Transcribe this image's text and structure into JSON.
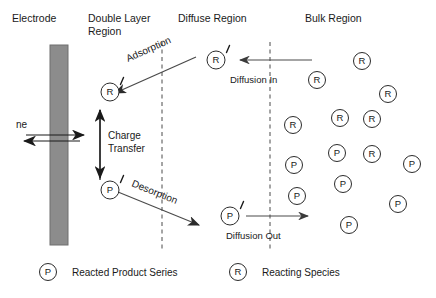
{
  "regions": [
    {
      "id": "electrode",
      "label": "Electrode",
      "x": 12,
      "y": 22
    },
    {
      "id": "double-layer",
      "label": "Double Layer",
      "x": 88,
      "y": 22
    },
    {
      "id": "double-layer-2",
      "label": "Region",
      "x": 88,
      "y": 35
    },
    {
      "id": "diffuse",
      "label": "Diffuse Region",
      "x": 178,
      "y": 22
    },
    {
      "id": "bulk",
      "label": "Bulk Region",
      "x": 305,
      "y": 22
    }
  ],
  "electrode": {
    "name": "electrode-bar",
    "color": "#8c8c8c",
    "x": 50,
    "y": 45,
    "width": 18,
    "height": 200
  },
  "dividers": [
    {
      "id": "divider-double-layer",
      "x": 162,
      "y1": 42,
      "y2": 250
    },
    {
      "id": "divider-diffuse",
      "x": 270,
      "y1": 42,
      "y2": 250
    }
  ],
  "electron_transfer": {
    "label": "ne",
    "label_x": 16,
    "label_y": 128,
    "y_forward": 135,
    "y_back": 141,
    "x_left": 22,
    "x_right": 84
  },
  "charge_transfer": {
    "label_line1": "Charge",
    "label_line2": "Transfer",
    "label_x": 108,
    "label_y1": 138,
    "label_y2": 151,
    "arrow_x": 100,
    "arrow_top": 108,
    "arrow_bottom": 180
  },
  "processes": [
    {
      "id": "adsorption",
      "label": "Adsorption",
      "x1": 196,
      "y1": 57,
      "x2": 113,
      "y2": 94,
      "label_x": 128,
      "label_y": 62,
      "rotation": -24
    },
    {
      "id": "desorption",
      "label": "Desorption",
      "x1": 116,
      "y1": 191,
      "x2": 199,
      "y2": 225,
      "label_x": 131,
      "label_y": 185,
      "rotation": 22
    },
    {
      "id": "diffusion-in",
      "label": "Diffusion In",
      "x1": 310,
      "y1": 60,
      "x2": 241,
      "y2": 60,
      "label_x": 232,
      "label_y": 82
    },
    {
      "id": "diffusion-out",
      "label": "Diffusion Out",
      "x1": 238,
      "y1": 216,
      "x2": 307,
      "y2": 216,
      "label_x": 228,
      "label_y": 238
    }
  ],
  "interface_species": [
    {
      "id": "R-adsorbed",
      "symbol": "R",
      "cx": 110,
      "cy": 92,
      "prime": true
    },
    {
      "id": "P-adsorbed",
      "symbol": "P",
      "cx": 110,
      "cy": 190,
      "prime": true
    },
    {
      "id": "R-diffuse",
      "symbol": "R",
      "cx": 216,
      "cy": 60,
      "prime": true
    },
    {
      "id": "P-diffuse",
      "symbol": "P",
      "cx": 230,
      "cy": 216,
      "prime": true
    }
  ],
  "bulk_species": [
    {
      "symbol": "R",
      "cx": 362,
      "cy": 61
    },
    {
      "symbol": "R",
      "cx": 317,
      "cy": 80
    },
    {
      "symbol": "R",
      "cx": 388,
      "cy": 94
    },
    {
      "symbol": "R",
      "cx": 340,
      "cy": 118
    },
    {
      "symbol": "R",
      "cx": 293,
      "cy": 125
    },
    {
      "symbol": "P",
      "cx": 337,
      "cy": 153
    },
    {
      "symbol": "R",
      "cx": 372,
      "cy": 154
    },
    {
      "symbol": "P",
      "cx": 294,
      "cy": 165
    },
    {
      "symbol": "P",
      "cx": 412,
      "cy": 164
    },
    {
      "symbol": "P",
      "cx": 343,
      "cy": 184
    },
    {
      "symbol": "P",
      "cx": 297,
      "cy": 196
    },
    {
      "symbol": "P",
      "cx": 398,
      "cy": 204
    },
    {
      "symbol": "P",
      "cx": 349,
      "cy": 225
    },
    {
      "symbol": "R",
      "cx": 372,
      "cy": 119
    }
  ],
  "legend": {
    "items": [
      {
        "id": "legend-product",
        "symbol": "P",
        "cx": 48,
        "cy": 272,
        "label": "Reacted Product Series",
        "label_x": 72
      },
      {
        "id": "legend-reactant",
        "symbol": "R",
        "cx": 238,
        "cy": 272,
        "label": "Reacting Species",
        "label_x": 262
      }
    ]
  }
}
